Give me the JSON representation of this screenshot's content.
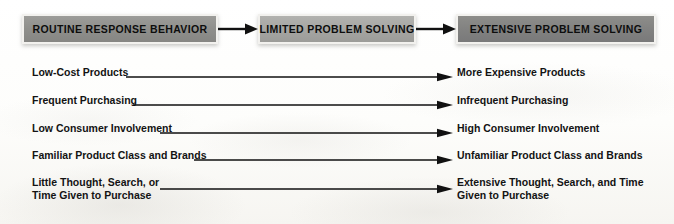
{
  "figure": {
    "background_color": "#fdfdfc"
  },
  "stages": [
    {
      "id": "routine-response-behavior",
      "label": "ROUTINE RESPONSE BEHAVIOR",
      "fill_color": "#8e8e8b",
      "border_color": "#f2f1ee",
      "text_color": "#0d0d0d"
    },
    {
      "id": "limited-problem-solving",
      "label": "LIMITED PROBLEM SOLVING",
      "fill_color": "#a5a5a2",
      "border_color": "#f2f1ee",
      "text_color": "#0d0d0d"
    },
    {
      "id": "extensive-problem-solving",
      "label": "EXTENSIVE PROBLEM SOLVING",
      "fill_color": "#818180",
      "border_color": "#f2f1ee",
      "text_color": "#0d0d0d"
    }
  ],
  "stage_connectors": [
    {
      "id": "connector-routine-to-limited",
      "icon": "arrow-right-icon"
    },
    {
      "id": "connector-limited-to-extensive",
      "icon": "arrow-right-icon"
    }
  ],
  "attribute_rows": [
    {
      "id": "cost",
      "left": "Low-Cost Products",
      "right": "More Expensive Products",
      "arrow_icon": "arrow-right-icon"
    },
    {
      "id": "purchase-frequency",
      "left": "Frequent Purchasing",
      "right": "Infrequent Purchasing",
      "arrow_icon": "arrow-right-icon"
    },
    {
      "id": "involvement",
      "left": "Low Consumer Involvement",
      "right": "High Consumer Involvement",
      "arrow_icon": "arrow-right-icon"
    },
    {
      "id": "familiarity",
      "left": "Familiar Product Class and Brands",
      "right": "Unfamiliar Product Class and Brands",
      "arrow_icon": "arrow-right-icon"
    },
    {
      "id": "thought-search-time",
      "left": "Little Thought, Search, or\nTime Given to Purchase",
      "right": "Extensive Thought, Search, and Time\nGiven to Purchase",
      "arrow_icon": "arrow-right-icon"
    }
  ],
  "colors": {
    "line": "#111111",
    "text": "#131313"
  }
}
